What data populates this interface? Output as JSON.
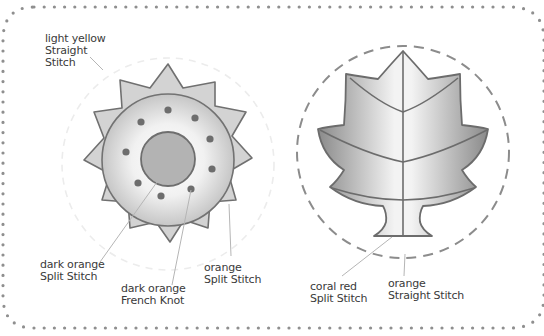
{
  "diagram": {
    "type": "embroidery-pattern",
    "colors": {
      "border_dots": "#8a8a8a",
      "outline": "#6e6e6e",
      "sun_spikes_fill": "#d2d2d2",
      "sun_disk_center": "#ffffff",
      "sun_disk_edge": "#c4c4c4",
      "sun_inner_circle": "#b0b0b0",
      "french_knot": "#6a6a6a",
      "leaf_light": "#f2f2f2",
      "leaf_dark": "#8c8c8c",
      "leaf_circle_dash": "#8a8a8a",
      "sun_circle_dash": "#eeeeee",
      "leader_line": "#b4b4b4",
      "label_text": "#3a3a3a"
    },
    "sun": {
      "labels": [
        {
          "id": "sun-outer-rays",
          "line1": "light yellow",
          "line2": "Straight",
          "line3": "Stitch"
        },
        {
          "id": "sun-inner-circle",
          "line1": "dark orange",
          "line2": "Split Stitch"
        },
        {
          "id": "sun-dots",
          "line1": "dark orange",
          "line2": "French Knot"
        },
        {
          "id": "sun-disk",
          "line1": "orange",
          "line2": "Split Stitch"
        }
      ],
      "french_knot_count": 9,
      "spike_count": 12
    },
    "leaf": {
      "labels": [
        {
          "id": "leaf-outline",
          "line1": "coral red",
          "line2": "Split Stitch"
        },
        {
          "id": "leaf-circle",
          "line1": "orange",
          "line2": "Straight Stitch"
        }
      ]
    }
  }
}
